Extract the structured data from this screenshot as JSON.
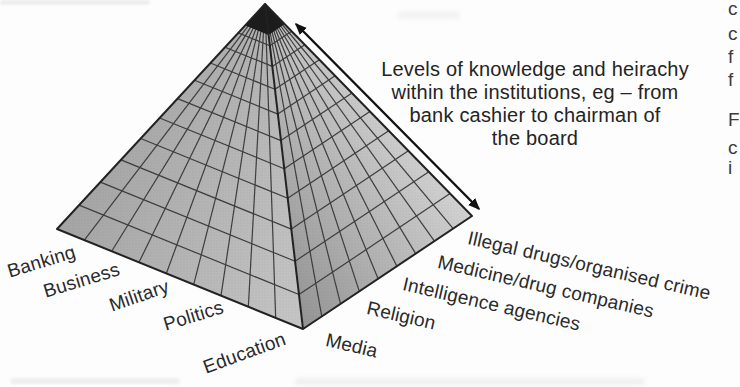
{
  "diagram": {
    "type": "pyramid-3d",
    "annotation": {
      "lines": [
        "Levels of knowledge and heirachy",
        "within the institutions, eg – from",
        "bank cashier to chairman of",
        "the board"
      ]
    },
    "left_labels": [
      "Banking",
      "Business",
      "Military",
      "Politics",
      "Education"
    ],
    "right_labels": [
      "Media",
      "Religion",
      "Intelligence agencies",
      "Medicine/drug companies",
      "Illegal drugs/organised crime"
    ],
    "pyramid": {
      "rows": 13,
      "columns_per_face": 9,
      "cap_color": "#1c1c1c",
      "grid_color": "#3d3d3d",
      "outline_color": "#222222",
      "left_face_from": "#a4a4a4",
      "left_face_to": "#c6c6c6",
      "right_face_from": "#949494",
      "right_face_to": "#d2d2d2",
      "arrow_color": "#111111"
    }
  },
  "edge_fragments": {
    "glyphs": [
      "c",
      "c",
      "f",
      "f",
      "F",
      "c",
      "i"
    ]
  }
}
